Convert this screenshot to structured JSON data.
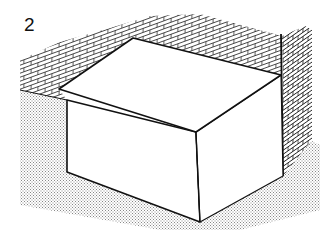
{
  "figure": {
    "number": "2",
    "colors": {
      "line": "#111111",
      "background": "#ffffff",
      "ground_stipple": "#9a9a9a"
    }
  }
}
